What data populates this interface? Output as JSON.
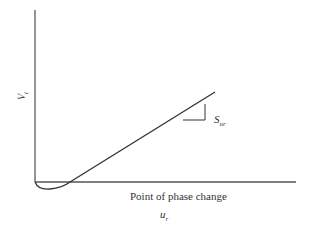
{
  "diagram": {
    "y_axis_label": {
      "main": "V",
      "sub": "t"
    },
    "x_axis_label": "Point of phase change",
    "x_axis_symbol": {
      "main": "u",
      "sub": "r"
    },
    "slope_label": {
      "main": "S",
      "sub": "ur"
    },
    "line_color": "#333333",
    "axis_color": "#555555"
  }
}
